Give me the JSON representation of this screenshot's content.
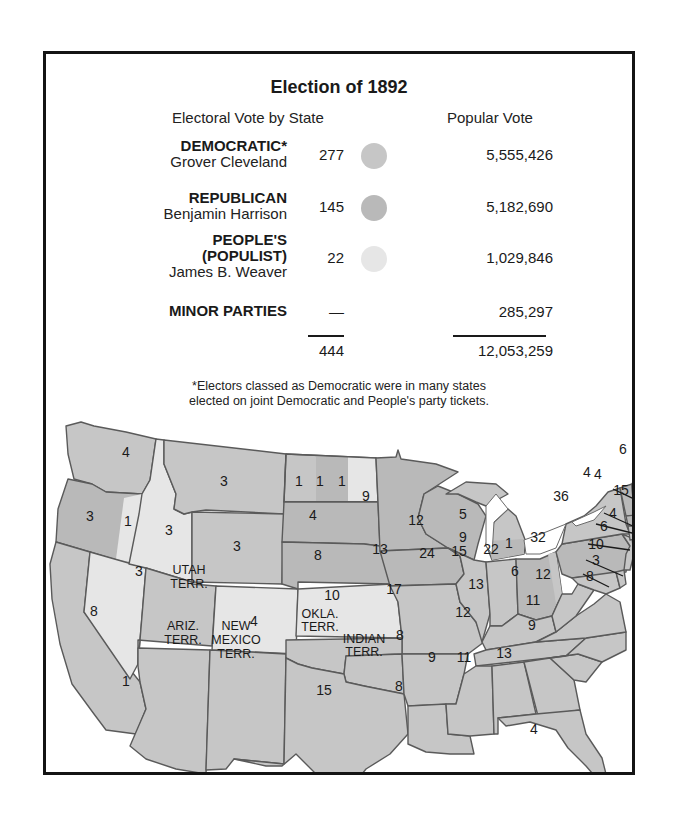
{
  "title": "Election of 1892",
  "subheads": {
    "electoral": "Electoral Vote by State",
    "popular": "Popular Vote"
  },
  "colors": {
    "democratic": "#c6c6c6",
    "republican": "#b9b9b9",
    "populist": "#e6e6e6",
    "border": "#5a5a5a"
  },
  "parties": [
    {
      "name": "DEMOCRATIC*",
      "candidate": "Grover Cleveland",
      "electoral": "277",
      "popular": "5,555,426",
      "color": "#c6c6c6"
    },
    {
      "name": "REPUBLICAN",
      "candidate": "Benjamin Harrison",
      "electoral": "145",
      "popular": "5,182,690",
      "color": "#b9b9b9"
    },
    {
      "name": "PEOPLE'S (POPULIST)",
      "name_line1": "PEOPLE'S",
      "name_line2": "(POPULIST)",
      "candidate": "James B. Weaver",
      "electoral": "22",
      "popular": "1,029,846",
      "color": "#e6e6e6"
    },
    {
      "name": "MINOR PARTIES",
      "candidate": "",
      "electoral": "—",
      "popular": "285,297",
      "color": ""
    }
  ],
  "totals": {
    "electoral": "444",
    "popular": "12,053,259"
  },
  "footnote": {
    "line1": "*Electors classed as Democratic were in many states",
    "line2": "elected on joint Democratic and People's party tickets."
  },
  "map": {
    "states": {
      "washington": "4",
      "oregon_rep": "3",
      "oregon_pop": "1",
      "california_dem": "8",
      "california_rep": "1",
      "idaho": "3",
      "nevada": "3",
      "montana": "3",
      "wyoming": "3",
      "colorado": "4",
      "north_dakota_1": "1",
      "north_dakota_2": "1",
      "north_dakota_3": "1",
      "south_dakota": "4",
      "nebraska": "8",
      "kansas": "10",
      "minnesota": "9",
      "iowa": "13",
      "missouri": "17",
      "arkansas": "8",
      "louisiana": "8",
      "texas": "15",
      "wisconsin": "12",
      "illinois": "24",
      "michigan_rep": "9",
      "michigan_dem": "5",
      "indiana": "15",
      "ohio_rep": "22",
      "ohio_dem": "1",
      "kentucky": "13",
      "tennessee": "12",
      "mississippi": "9",
      "alabama": "11",
      "georgia": "13",
      "florida": "4",
      "south_carolina": "9",
      "north_carolina": "11",
      "virginia": "12",
      "west_virginia": "6",
      "pennsylvania": "32",
      "new_york": "36",
      "maine": "6",
      "vermont": "4",
      "new_hampshire": "4",
      "massachusetts": "15",
      "rhode_island": "4",
      "connecticut": "6",
      "new_jersey": "10",
      "delaware": "3",
      "maryland": "8"
    },
    "territories": {
      "utah_1": "UTAH",
      "utah_2": "TERR.",
      "arizona_1": "ARIZ.",
      "arizona_2": "TERR.",
      "new_mexico_1": "NEW",
      "new_mexico_2": "MEXICO",
      "new_mexico_3": "TERR.",
      "oklahoma_1": "OKLA.",
      "oklahoma_2": "TERR.",
      "indian_1": "INDIAN",
      "indian_2": "TERR."
    }
  }
}
